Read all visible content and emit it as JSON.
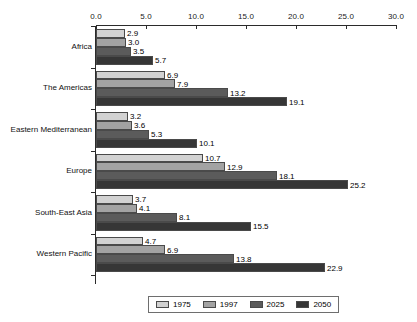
{
  "chart_data": {
    "type": "bar",
    "orientation": "horizontal",
    "title": "",
    "xlabel": "",
    "ylabel": "",
    "xlim": [
      0.0,
      30.0
    ],
    "grid": false,
    "legend_position": "bottom",
    "xticks": [
      "0.0",
      "5.0",
      "10.0",
      "15.0",
      "20.0",
      "25.0",
      "30.0"
    ],
    "xtick_values": [
      0,
      5,
      10,
      15,
      20,
      25,
      30
    ],
    "categories": [
      "Africa",
      "The Americas",
      "Eastern Mediterranean",
      "Europe",
      "South-East Asia",
      "Western Pacific"
    ],
    "series": [
      {
        "name": "1975",
        "color": "#d2d2d2",
        "values": [
          2.9,
          6.9,
          3.2,
          10.7,
          3.7,
          4.7
        ],
        "labels": [
          "2.9",
          "6.9",
          "3.2",
          "10.7",
          "3.7",
          "4.7"
        ]
      },
      {
        "name": "1997",
        "color": "#a3a3a3",
        "values": [
          3.0,
          7.9,
          3.6,
          12.9,
          4.1,
          6.9
        ],
        "labels": [
          "3.0",
          "7.9",
          "3.6",
          "12.9",
          "4.1",
          "6.9"
        ]
      },
      {
        "name": "2025",
        "color": "#5b5b5b",
        "values": [
          3.5,
          13.2,
          5.3,
          18.1,
          8.1,
          13.8
        ],
        "labels": [
          "3.5",
          "13.2",
          "5.3",
          "18.1",
          "8.1",
          "13.8"
        ]
      },
      {
        "name": "2050",
        "color": "#363636",
        "values": [
          5.7,
          19.1,
          10.1,
          25.2,
          15.5,
          22.9
        ],
        "labels": [
          "5.7",
          "19.1",
          "10.1",
          "25.2",
          "15.5",
          "22.9"
        ]
      }
    ]
  }
}
